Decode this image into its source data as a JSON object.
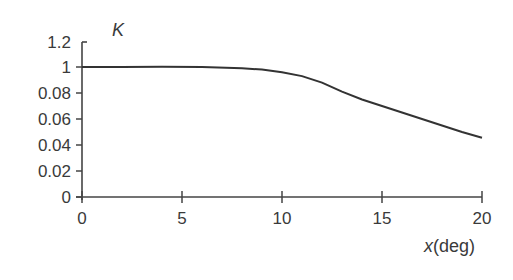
{
  "chart_data": {
    "type": "line",
    "title": "",
    "xlabel": "x(deg)",
    "ylabel": "K",
    "xlim": [
      0,
      20
    ],
    "y_tick_labels": [
      "1.2",
      "1",
      "0.08",
      "0.06",
      "0.04",
      "0.02",
      "0"
    ],
    "x_tick_labels": [
      "0",
      "5",
      "10",
      "15",
      "20"
    ],
    "grid": false,
    "legend": null,
    "series": [
      {
        "name": "K",
        "x": [
          0,
          2,
          4,
          6,
          8,
          9,
          10,
          11,
          12,
          13,
          14,
          15,
          16,
          17,
          18,
          19,
          20
        ],
        "y_pixel_fraction": [
          1.0,
          1.0,
          1.002,
          1.0,
          0.99,
          0.98,
          0.96,
          0.93,
          0.88,
          0.81,
          0.75,
          0.7,
          0.65,
          0.6,
          0.55,
          0.5,
          0.455
        ],
        "y_approx_on_axis": [
          1.0,
          1.0,
          1.0,
          1.0,
          0.099,
          0.098,
          0.096,
          0.092,
          0.086,
          0.077,
          0.069,
          0.062,
          0.055,
          0.048,
          0.041,
          0.034,
          0.026
        ]
      }
    ]
  },
  "labels": {
    "ylabel_main": "K",
    "xlabel_var": "x",
    "xlabel_unit": "(deg)"
  }
}
